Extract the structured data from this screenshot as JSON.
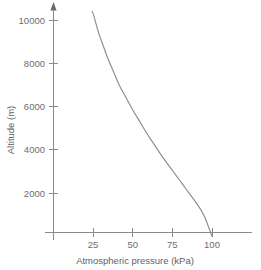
{
  "chart_data": {
    "type": "line",
    "title": "",
    "xlabel": "Atmospheric pressure (kPa)",
    "ylabel": "Altitude (m)",
    "xlim": [
      0,
      125
    ],
    "ylim": [
      0,
      10800
    ],
    "grid": false,
    "legend": null,
    "xticks": [
      25,
      50,
      75,
      100
    ],
    "xtick_labels": [
      "25",
      "50",
      "75",
      "100"
    ],
    "yticks": [
      2000,
      4000,
      6000,
      8000,
      10000
    ],
    "ytick_labels": [
      "2000",
      "4000",
      "6000",
      "8000",
      "10000"
    ],
    "series": [
      {
        "name": "Atmospheric pressure vs altitude",
        "color": "#8c8c8c",
        "x": [
          24.5,
          25.5,
          27,
          29,
          31.5,
          34.5,
          38,
          41.5,
          45.5,
          50,
          54.5,
          59,
          63.5,
          68,
          72.5,
          77,
          81.5,
          86,
          90.5,
          95,
          100
        ],
        "y": [
          10400,
          10200,
          9800,
          9300,
          8800,
          8200,
          7600,
          7000,
          6450,
          5850,
          5300,
          4750,
          4250,
          3750,
          3300,
          2850,
          2400,
          1950,
          1500,
          950,
          0
        ]
      }
    ],
    "annotations": [
      {
        "name": "y-axis-arrow",
        "description": "upward arrowhead at top of vertical axis"
      }
    ]
  },
  "axes": {
    "x_axis_label": "Atmospheric pressure (kPa)",
    "y_axis_label": "Altitude (m)"
  },
  "colors": {
    "background": "#ffffff",
    "axis": "#8a8a8a",
    "curve": "#8c8c8c",
    "text": "#6e6e6e"
  }
}
